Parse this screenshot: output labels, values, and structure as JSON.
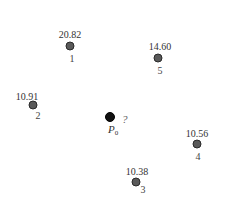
{
  "diagram": {
    "type": "scatter-points-with-values",
    "points": [
      {
        "index": "1",
        "value": "20.82",
        "x": 70,
        "y": 46
      },
      {
        "index": "2",
        "value": "10.91",
        "x": 33,
        "y": 105
      },
      {
        "index": "3",
        "value": "10.38",
        "x": 136,
        "y": 182
      },
      {
        "index": "4",
        "value": "10.56",
        "x": 197,
        "y": 144
      },
      {
        "index": "5",
        "value": "14.60",
        "x": 158,
        "y": 58
      }
    ],
    "target": {
      "label": "P",
      "subscript": "0",
      "value": "?",
      "x": 110,
      "y": 117
    },
    "colors": {
      "known_point_fill": "#5a5a5a",
      "target_point_fill": "#111111",
      "text": "#333333"
    }
  }
}
